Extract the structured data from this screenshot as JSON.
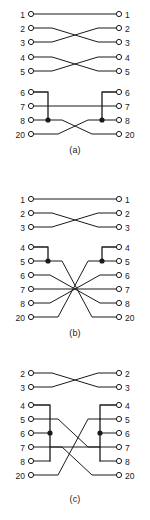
{
  "figure": {
    "line_color": "#1a1a1a",
    "background_color": "#ffffff",
    "terminal_fill": "#ffffff",
    "junction_fill": "#1a1a1a"
  },
  "diagrams": [
    {
      "id": "a",
      "caption": "(a)",
      "left_pins": [
        "1",
        "2",
        "3",
        "4",
        "5",
        "6",
        "7",
        "8",
        "20"
      ],
      "right_pins": [
        "1",
        "2",
        "3",
        "4",
        "5",
        "6",
        "7",
        "8",
        "20"
      ],
      "junction_dots": [
        {
          "side": "left",
          "pin": "8"
        },
        {
          "side": "right",
          "pin": "8"
        }
      ],
      "bus_groups": [
        {
          "side": "left",
          "pins": [
            "6",
            "8"
          ]
        },
        {
          "side": "right",
          "pins": [
            "6",
            "8"
          ]
        }
      ],
      "connections": [
        {
          "from": "1",
          "to": "1"
        },
        {
          "from": "2",
          "to": "3"
        },
        {
          "from": "3",
          "to": "2"
        },
        {
          "from": "4",
          "to": "5"
        },
        {
          "from": "5",
          "to": "4"
        },
        {
          "from": "6+8",
          "to": "20"
        },
        {
          "from": "7",
          "to": "7"
        },
        {
          "from": "20",
          "to": "6+8"
        }
      ]
    },
    {
      "id": "b",
      "caption": "(b)",
      "left_pins": [
        "1",
        "2",
        "3",
        "4",
        "5",
        "6",
        "7",
        "8",
        "20"
      ],
      "right_pins": [
        "1",
        "2",
        "3",
        "4",
        "5",
        "6",
        "7",
        "8",
        "20"
      ],
      "junction_dots": [
        {
          "side": "left",
          "pin": "5"
        },
        {
          "side": "right",
          "pin": "5"
        }
      ],
      "bus_groups": [
        {
          "side": "left",
          "pins": [
            "4",
            "5"
          ]
        },
        {
          "side": "right",
          "pins": [
            "4",
            "5"
          ]
        }
      ],
      "connections": [
        {
          "from": "1",
          "to": "1"
        },
        {
          "from": "2",
          "to": "3"
        },
        {
          "from": "3",
          "to": "2"
        },
        {
          "from": "4+5",
          "to": "20"
        },
        {
          "from": "6",
          "to": "8"
        },
        {
          "from": "7",
          "to": "7"
        },
        {
          "from": "8",
          "to": "6"
        },
        {
          "from": "20",
          "to": "4+5"
        }
      ]
    },
    {
      "id": "c",
      "caption": "(c)",
      "left_pins": [
        "2",
        "3",
        "4",
        "5",
        "6",
        "7",
        "8",
        "20"
      ],
      "right_pins": [
        "2",
        "3",
        "4",
        "5",
        "6",
        "7",
        "8",
        "20"
      ],
      "junction_dots": [
        {
          "side": "left",
          "pin": "6"
        },
        {
          "side": "right",
          "pin": "6"
        }
      ],
      "bus_groups": [
        {
          "side": "left",
          "pins": [
            "4",
            "6",
            "8"
          ]
        },
        {
          "side": "right",
          "pins": [
            "4",
            "6",
            "8"
          ]
        }
      ],
      "connections": [
        {
          "from": "2",
          "to": "3"
        },
        {
          "from": "3",
          "to": "2"
        },
        {
          "from": "4+6+8",
          "to": "20"
        },
        {
          "from": "5",
          "to": "4+6+8"
        },
        {
          "from": "7",
          "to": "7"
        },
        {
          "from": "20",
          "to": "4+6+8"
        }
      ]
    }
  ]
}
